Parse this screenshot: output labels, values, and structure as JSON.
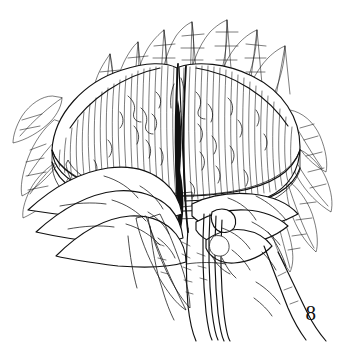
{
  "figure": {
    "number": "8",
    "caption": "",
    "style": "pen-and-ink line drawing",
    "medium": "black ink on white",
    "background_color": "#ffffff",
    "ink_color": "#111111",
    "width_px": 346,
    "height_px": 342,
    "parts": [
      {
        "name": "domed-cap",
        "description": "large rounded dome with fine vertical striations and crack lines"
      },
      {
        "name": "central-cleft",
        "description": "dark vertical fissure splitting the dome into left and right lobes"
      },
      {
        "name": "left-cap-lobe",
        "description": "left half of dome, vertically striated, lighter"
      },
      {
        "name": "right-cap-lobe",
        "description": "right half of dome, vertically striated with mottled crack texture"
      },
      {
        "name": "shadow-band",
        "description": "dark cross-hatched shadow band beneath the cap rim"
      },
      {
        "name": "basal-lobes-left",
        "description": "three overlapping finger-like lobes at lower left"
      },
      {
        "name": "basal-lobes-right",
        "description": "overlapping finger-like lobes at lower right"
      },
      {
        "name": "descending-stalks",
        "description": "long parallel lines descending from the lower right lobes"
      },
      {
        "name": "fronds-upper",
        "description": "spiky cross-hatched fronds radiating above the cap"
      },
      {
        "name": "fronds-left",
        "description": "feathery cross-hatched fronds on the left flank"
      },
      {
        "name": "fronds-right",
        "description": "feathery cross-hatched fronds on the right flank"
      }
    ]
  }
}
